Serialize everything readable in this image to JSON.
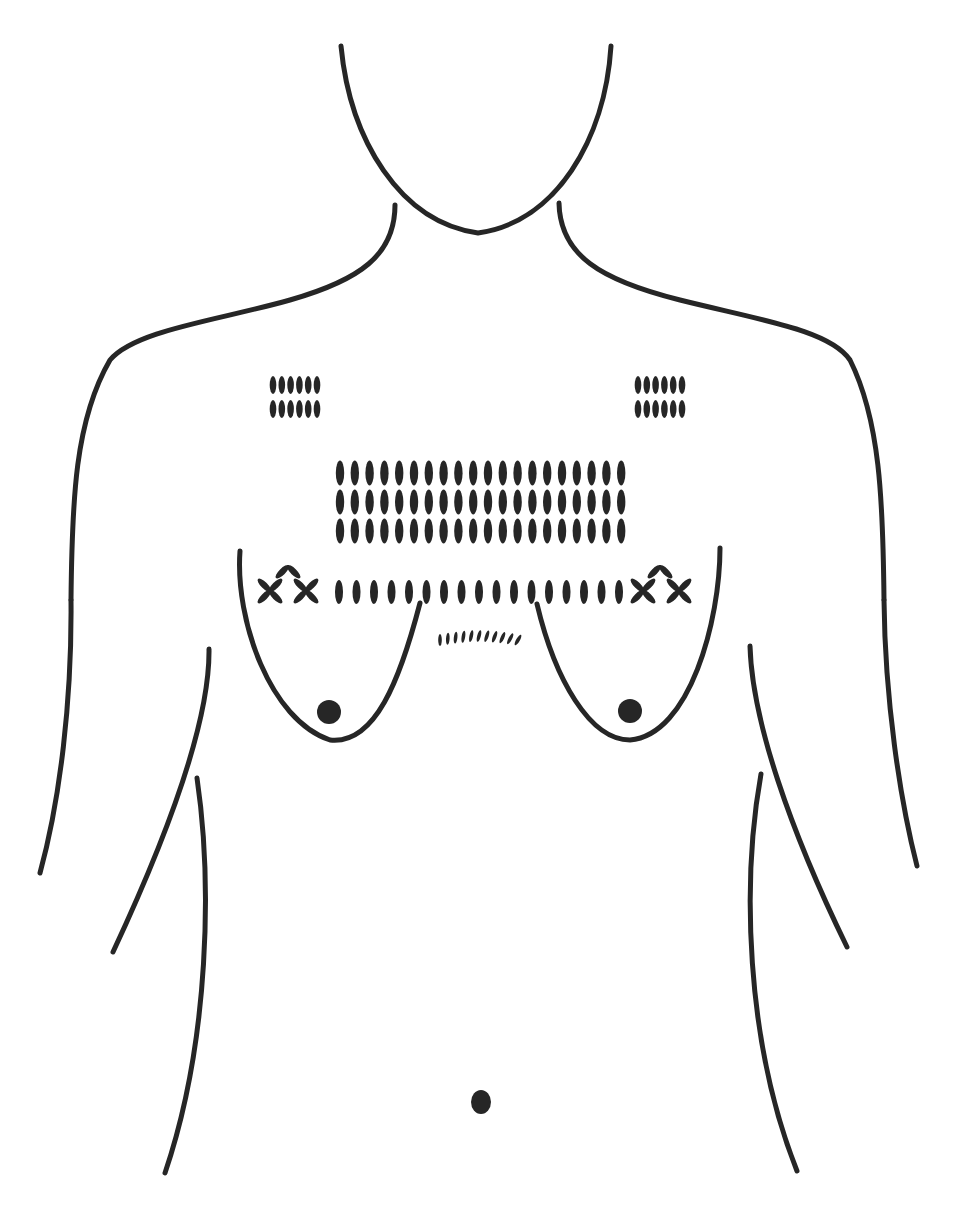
{
  "figure": {
    "ink_color": "#262626",
    "background": "#ffffff",
    "stroke_width": 5
  },
  "outlines": [
    {
      "name": "chin-curve",
      "d": "M 341 46 C 350 140, 400 222, 478 233 C 556 222, 605 140, 611 46"
    },
    {
      "name": "neck-left",
      "d": "M 395 205 C 395 255, 360 280, 290 300 C 220 320, 135 330, 110 360 C 75 420, 72 500, 71 600"
    },
    {
      "name": "neck-right",
      "d": "M 559 203 C 560 255, 600 280, 680 300 C 760 320, 830 330, 850 360 C 880 420, 883 500, 884 600"
    },
    {
      "name": "left-arm-outer",
      "d": "M 71 600 C 72 700, 60 800, 40 873"
    },
    {
      "name": "right-arm-outer",
      "d": "M 884 600 C 885 700, 900 800, 917 866"
    },
    {
      "name": "left-arm-inner",
      "d": "M 209 649 C 210 720, 170 830, 113 952"
    },
    {
      "name": "right-arm-inner",
      "d": "M 750 646 C 752 720, 790 830, 847 947"
    },
    {
      "name": "left-waist",
      "d": "M 197 778 C 212 880, 210 1040, 165 1173"
    },
    {
      "name": "right-waist",
      "d": "M 761 774 C 742 880, 745 1040, 797 1171"
    },
    {
      "name": "left-breast",
      "d": "M 240 551 C 235 620, 270 720, 330 740 C 375 745, 400 680, 420 603"
    },
    {
      "name": "right-breast",
      "d": "M 537 604 C 555 680, 590 740, 630 740 C 690 735, 720 620, 720 548"
    }
  ],
  "marks": {
    "nipples": [
      {
        "cx": 329,
        "cy": 712,
        "r": 12
      },
      {
        "cx": 630,
        "cy": 711,
        "r": 12
      }
    ],
    "navel": {
      "cx": 481,
      "cy": 1102,
      "rx": 10,
      "ry": 12
    },
    "shoulder_blocks": [
      {
        "name": "left-shoulder-marks",
        "x0": 273,
        "y0": 385,
        "cols": 6,
        "rows": 2,
        "dx": 8.8,
        "dy": 24,
        "rx": 3.3,
        "ry": 9
      },
      {
        "name": "right-shoulder-marks",
        "x0": 638,
        "y0": 385,
        "cols": 6,
        "rows": 2,
        "dx": 8.8,
        "dy": 24,
        "rx": 3.3,
        "ry": 9
      }
    ],
    "chest_block": {
      "name": "central-chest-marks",
      "x0": 340,
      "y0": 473,
      "cols": 20,
      "rows": 3,
      "dx": 14.8,
      "dy": 29,
      "rx": 4.2,
      "ry": 12.5
    },
    "horizontal_row": {
      "name": "under-chest-row",
      "x0": 339,
      "y0": 592,
      "count": 17,
      "dx": 17.5,
      "rx": 4,
      "ry": 12
    },
    "cross_motifs": [
      {
        "name": "left-cross-top",
        "cx": 288,
        "cy": 566,
        "arms": 2
      },
      {
        "name": "left-cross-1",
        "cx": 270,
        "cy": 591,
        "arms": 4
      },
      {
        "name": "left-cross-2",
        "cx": 306,
        "cy": 591,
        "arms": 4
      },
      {
        "name": "right-cross-top",
        "cx": 660,
        "cy": 566,
        "arms": 2
      },
      {
        "name": "right-cross-1",
        "cx": 643,
        "cy": 591,
        "arms": 4
      },
      {
        "name": "right-cross-2",
        "cx": 679,
        "cy": 591,
        "arms": 4
      }
    ],
    "small_arc": {
      "name": "sternum-arc-marks",
      "count": 11,
      "x_start": 440,
      "x_end": 518,
      "y_center": 640,
      "sag": -4,
      "rx": 1.8,
      "ry": 6
    }
  }
}
